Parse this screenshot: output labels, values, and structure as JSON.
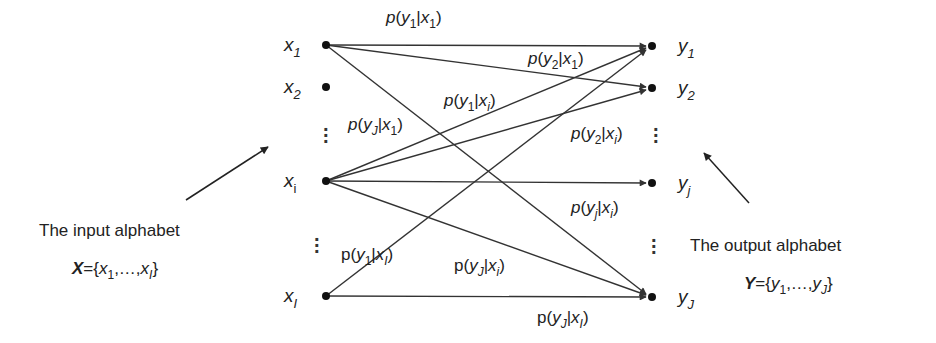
{
  "diagram": {
    "type": "discrete memoryless channel transition diagram",
    "input_nodes": [
      {
        "id": "x1",
        "base": "x",
        "sub": "1",
        "x": 326,
        "y": 45
      },
      {
        "id": "x2",
        "base": "x",
        "sub": "2",
        "x": 326,
        "y": 87
      },
      {
        "id": "xi",
        "base": "x",
        "sub": "i",
        "x": 326,
        "y": 181
      },
      {
        "id": "xI",
        "base": "x",
        "sub": "I",
        "x": 326,
        "y": 296
      }
    ],
    "output_nodes": [
      {
        "id": "y1",
        "base": "y",
        "sub": "1",
        "x": 652,
        "y": 46
      },
      {
        "id": "y2",
        "base": "y",
        "sub": "2",
        "x": 652,
        "y": 88
      },
      {
        "id": "yj",
        "base": "y",
        "sub": "j",
        "x": 652,
        "y": 183
      },
      {
        "id": "yJ",
        "base": "y",
        "sub": "J",
        "x": 652,
        "y": 297
      }
    ],
    "edges": [
      {
        "from": "x1",
        "to": "y1"
      },
      {
        "from": "x1",
        "to": "y2"
      },
      {
        "from": "x1",
        "to": "yJ"
      },
      {
        "from": "xi",
        "to": "y1"
      },
      {
        "from": "xi",
        "to": "y2"
      },
      {
        "from": "xi",
        "to": "yj"
      },
      {
        "from": "xi",
        "to": "yJ"
      },
      {
        "from": "xI",
        "to": "y1"
      },
      {
        "from": "xI",
        "to": "yJ"
      }
    ],
    "edge_labels": [
      {
        "id": "p_y1_x1",
        "p": "p",
        "y": "1",
        "x": "1"
      },
      {
        "id": "p_y2_x1",
        "p": "p",
        "y": "2",
        "x": "1"
      },
      {
        "id": "p_y1_xi",
        "p": "p",
        "y": "1",
        "x": "i"
      },
      {
        "id": "p_yJ_x1",
        "p": "p",
        "y": "J",
        "x": "1"
      },
      {
        "id": "p_y2_xi",
        "p": "p",
        "y": "2",
        "x": "i"
      },
      {
        "id": "p_yj_xi",
        "p": "p",
        "y": "j",
        "x": "i"
      },
      {
        "id": "p_y1_xI",
        "p": "p",
        "y": "1",
        "x": "I"
      },
      {
        "id": "p_yJ_xi",
        "p": "p",
        "y": "J",
        "x": "i"
      },
      {
        "id": "p_yJ_xI",
        "p": "p",
        "y": "J",
        "x": "I"
      }
    ],
    "input_caption": "The input alphabet",
    "input_set": {
      "symbol": "X",
      "eq": "={",
      "first_base": "x",
      "first_sub": "1",
      "ellipsis": ",…,",
      "last_base": "x",
      "last_sub": "I",
      "close": "}"
    },
    "output_caption": "The output alphabet",
    "output_set": {
      "symbol": "Y",
      "eq": "={",
      "first_base": "y",
      "first_sub": "1",
      "ellipsis": ",…,",
      "last_base": "y",
      "last_sub": "J",
      "close": "}"
    },
    "colors": {
      "line": "#333333",
      "node": "#111111",
      "text": "#222222"
    }
  }
}
